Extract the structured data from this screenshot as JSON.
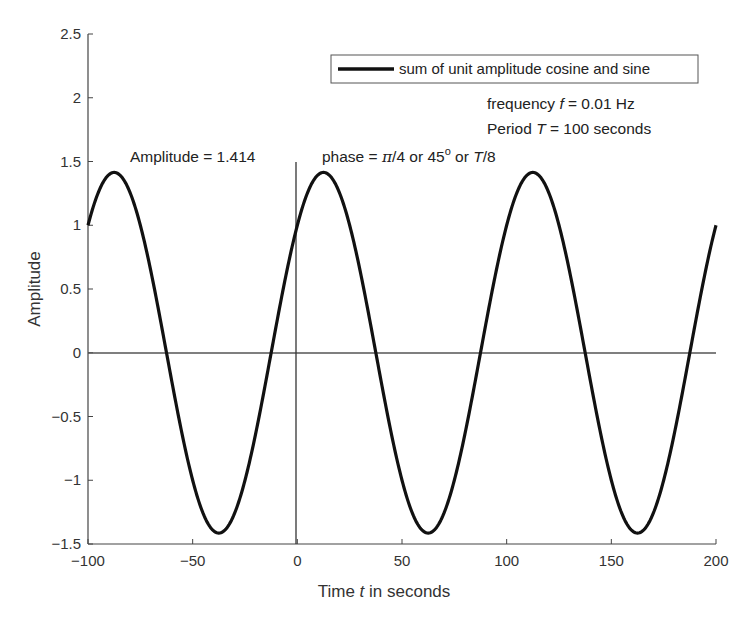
{
  "chart_data": {
    "type": "line",
    "title": "",
    "xlabel": "Time t in seconds",
    "ylabel": "Amplitude",
    "xlim": [
      -100,
      200
    ],
    "ylim": [
      -1.5,
      2.5
    ],
    "xticks": [
      "-100",
      "-50",
      "0",
      "50",
      "100",
      "150",
      "200"
    ],
    "yticks": [
      "-1.5",
      "-1",
      "-0.5",
      "0",
      "0.5",
      "1",
      "1.5",
      "2",
      "2.5"
    ],
    "grid": false,
    "legend_position": "upper right",
    "series": [
      {
        "name": "sum of unit amplitude cosine and sine",
        "function": "cos(2*pi*0.01*t) + sin(2*pi*0.01*t)",
        "amplitude": 1.414,
        "frequency_hz": 0.01,
        "period_s": 100,
        "x": [
          -100,
          -87.5,
          -62.5,
          -37.5,
          -12.5,
          0,
          12.5,
          37.5,
          62.5,
          87.5,
          112.5,
          137.5,
          162.5,
          187.5,
          200
        ],
        "values": [
          1,
          1.414,
          0,
          -1.414,
          0,
          1,
          1.414,
          0,
          -1.414,
          0,
          1.414,
          0,
          -1.414,
          0,
          1
        ],
        "color": "#111111"
      }
    ],
    "reference_lines": [
      {
        "type": "horizontal",
        "y": 0
      },
      {
        "type": "vertical",
        "x": 0,
        "y_range": [
          -1.5,
          1.45
        ]
      }
    ],
    "annotations": [
      {
        "text": "Amplitude = 1.414",
        "x": -83,
        "y": 1.5
      },
      {
        "text_prefix": "phase = ",
        "pi": "π",
        "text_mid": "/4 or 45",
        "sup": "o",
        "text_mid2": " or ",
        "italic_T": "T",
        "text_suffix": "/8",
        "x": 7,
        "y": 1.5
      },
      {
        "text_prefix": "frequency ",
        "italic": "f",
        "text_suffix": " = 0.01 Hz"
      },
      {
        "text_prefix": "Period ",
        "italic": "T",
        "text_suffix": " = 100 seconds"
      }
    ]
  },
  "labels": {
    "xlabel_prefix": "Time ",
    "xlabel_italic": "t",
    "xlabel_suffix": " in seconds",
    "ylabel": "Amplitude",
    "legend": "sum of unit amplitude cosine and sine",
    "amplitude_annot": "Amplitude = 1.414",
    "phase_prefix": "phase = ",
    "phase_pi": "π",
    "phase_mid": "/4 or 45",
    "phase_sup": "o",
    "phase_or": " or ",
    "phase_T": "T",
    "phase_suffix": "/8",
    "freq_prefix": "frequency ",
    "freq_italic": "f",
    "freq_suffix": " = 0.01 Hz",
    "period_prefix": "Period ",
    "period_italic": "T",
    "period_suffix": " = 100 seconds"
  },
  "ticks": {
    "x": [
      "−100",
      "−50",
      "0",
      "50",
      "100",
      "150",
      "200"
    ],
    "y": [
      "−1.5",
      "−1",
      "−0.5",
      "0",
      "0.5",
      "1",
      "1.5",
      "2",
      "2.5"
    ]
  }
}
